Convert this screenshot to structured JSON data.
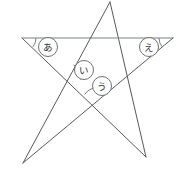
{
  "figure": {
    "name": "pentagram-angle-figure",
    "background_color": "#ffffff",
    "stroke_color": "#555a5e",
    "chord_color": "#7d8286",
    "width": 188,
    "height": 179
  },
  "vertices": [
    {
      "id": "top",
      "label": "top-point",
      "x": 110,
      "y": 2
    },
    {
      "id": "left",
      "label": "left-point",
      "x": 22,
      "y": 38
    },
    {
      "id": "right",
      "label": "right-point",
      "x": 173,
      "y": 38
    },
    {
      "id": "bottom_left",
      "label": "bottom-left-point",
      "x": 23,
      "y": 163
    },
    {
      "id": "bottom_right",
      "label": "bottom-right-point",
      "x": 146,
      "y": 157
    }
  ],
  "edges": [
    {
      "id": "edge-top-bottomright",
      "from": "top",
      "to": "bottom_right"
    },
    {
      "id": "edge-bottomright-left",
      "from": "bottom_right",
      "to": "left"
    },
    {
      "id": "edge-left-right",
      "from": "left",
      "to": "right"
    },
    {
      "id": "edge-right-bottomleft",
      "from": "right",
      "to": "bottom_left"
    },
    {
      "id": "edge-bottomleft-top",
      "from": "bottom_left",
      "to": "top"
    }
  ],
  "labels": [
    {
      "id": "label-a",
      "text": "あ",
      "romaji": "a",
      "cx": 48,
      "cy": 47,
      "r": 9.5,
      "arc": {
        "cx": 22,
        "cy": 38,
        "r": 14,
        "start_deg": 0,
        "end_deg": 39
      }
    },
    {
      "id": "label-i",
      "text": "い",
      "romaji": "i",
      "cx": 84,
      "cy": 70,
      "r": 9.5,
      "arc": {
        "cx": 69,
        "cy": 76,
        "r": 12,
        "start_deg": -68,
        "end_deg": 18
      }
    },
    {
      "id": "label-u",
      "text": "う",
      "romaji": "u",
      "cx": 102,
      "cy": 86,
      "r": 9.5,
      "arc": {
        "cx": 96,
        "cy": 101,
        "r": 13,
        "start_deg": -150,
        "end_deg": -32
      }
    },
    {
      "id": "label-e",
      "text": "え",
      "romaji": "e",
      "cx": 149,
      "cy": 47,
      "r": 9.5,
      "arc": {
        "cx": 173,
        "cy": 38,
        "r": 14,
        "start_deg": 141,
        "end_deg": 180
      }
    }
  ]
}
